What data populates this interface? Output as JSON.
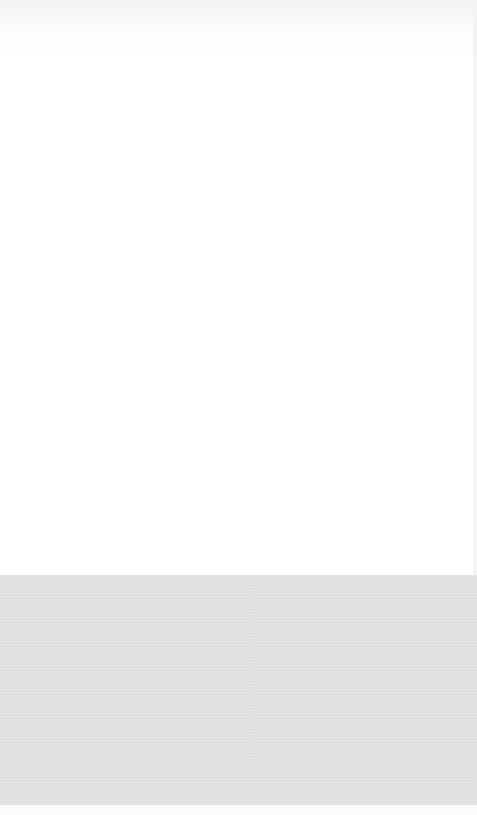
{
  "screen": {
    "width": 477,
    "height": 815,
    "description": "blank screen with no visible text or controls"
  },
  "regions": {
    "top": {
      "color": "#ffffff",
      "height": 575
    },
    "bottom_panel": {
      "color": "#e3e3e3",
      "height": 230
    },
    "bottom_strip": {
      "color": "#fbfbfb",
      "height": 10
    }
  }
}
